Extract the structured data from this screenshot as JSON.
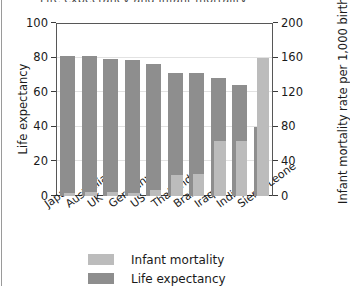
{
  "figure": {
    "title_sliver": "Life expectancy and infant mortality"
  },
  "chart_data": {
    "type": "bar",
    "title": "Life expectancy and infant mortality",
    "xlabel": "",
    "categories": [
      "Japan",
      "Australia",
      "UK",
      "Germany",
      "US",
      "Thailand",
      "Brazil",
      "Iraq",
      "India",
      "Sierra Leone"
    ],
    "series": [
      {
        "name": "Life expectancy",
        "axis": "left",
        "unit": "years",
        "color": "#8e8e8e",
        "values": [
          81,
          81,
          79,
          78.5,
          76.5,
          71,
          71,
          68,
          64,
          40
        ]
      },
      {
        "name": "Infant mortality",
        "axis": "right",
        "unit": "per 1,000 births",
        "color": "#bcbcbc",
        "values": [
          3,
          5,
          5,
          4,
          7,
          24,
          26,
          64,
          64,
          160
        ]
      }
    ],
    "left_axis": {
      "label": "Life expectancy",
      "ticks": [
        0,
        20,
        40,
        60,
        80,
        100
      ],
      "ylim": [
        0,
        100
      ]
    },
    "right_axis": {
      "label": "Infant mortality rate per 1,000 births",
      "ticks": [
        0,
        40,
        80,
        120,
        160,
        200
      ],
      "ylim": [
        0,
        200
      ]
    },
    "grid": true,
    "legend_position": "bottom",
    "legend": [
      "Infant mortality",
      "Life expectancy"
    ]
  },
  "legend_items": [
    {
      "label": "Infant mortality",
      "color": "#bcbcbc"
    },
    {
      "label": "Life expectancy",
      "color": "#8e8e8e"
    }
  ]
}
